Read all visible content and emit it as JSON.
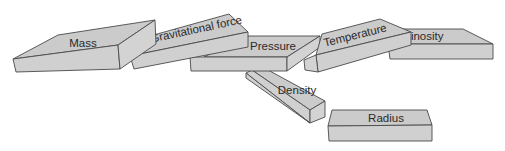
{
  "diagram": {
    "type": "stacked-blocks",
    "colors": {
      "block_fill": "#cbcbcb",
      "block_side": "#d3d3d3",
      "outline": "#4a4a4a",
      "text": "#2a2a2a",
      "background": "#ffffff"
    },
    "blocks": [
      {
        "id": "mass",
        "label": "Mass"
      },
      {
        "id": "gravitational-force",
        "label": "Gravitational force"
      },
      {
        "id": "pressure",
        "label": "Pressure"
      },
      {
        "id": "temperature",
        "label": "Temperature"
      },
      {
        "id": "luminosity",
        "label": "Luminosity"
      },
      {
        "id": "density",
        "label": "Density"
      },
      {
        "id": "radius",
        "label": "Radius"
      }
    ]
  }
}
